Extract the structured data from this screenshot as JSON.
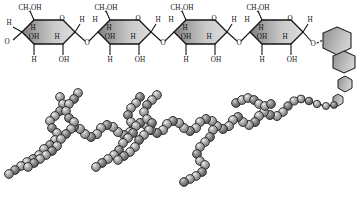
{
  "figure": {
    "name": "polysaccharide-structure-diagram",
    "background_color": "#ffffff",
    "ring_fill_dark": "#8a8a8a",
    "ring_fill_light": "#d8d8d8",
    "bond_color": "#1a1a1a",
    "bead_fill": "#9a9a9a",
    "bead_outline": "#2b2b2b",
    "bead_highlight": "#e2e2e2"
  },
  "glucose_rings": [
    {
      "index": 1,
      "top_label": "CH2OH",
      "top_label_main": "CH",
      "top_label_sub": "2",
      "top_label_tail": "OH",
      "ring_oxygen": "O",
      "left_h": "H",
      "left_o": "O",
      "interior_upper_h": "H",
      "interior_oh": "OH",
      "interior_right_h": "H",
      "bottom_left": "H",
      "bottom_right": "OH",
      "right_h": "H"
    },
    {
      "index": 2,
      "top_label": "CH2OH",
      "top_label_main": "CH",
      "top_label_sub": "2",
      "top_label_tail": "OH",
      "ring_oxygen": "O",
      "left_h": "H",
      "left_o": "O",
      "interior_upper_h": "H",
      "interior_oh": "OH",
      "interior_right_h": "H",
      "bottom_left": "H",
      "bottom_right": "OH",
      "right_h": "H"
    },
    {
      "index": 3,
      "top_label": "CH2OH",
      "top_label_main": "CH",
      "top_label_sub": "2",
      "top_label_tail": "OH",
      "ring_oxygen": "O",
      "left_h": "H",
      "left_o": "O",
      "interior_upper_h": "H",
      "interior_oh": "OH",
      "interior_right_h": "H",
      "bottom_left": "H",
      "bottom_right": "OH",
      "right_h": "H"
    },
    {
      "index": 4,
      "top_label": "CH2OH",
      "top_label_main": "CH",
      "top_label_sub": "2",
      "top_label_tail": "OH",
      "ring_oxygen": "O",
      "left_h": "H",
      "left_o": "O",
      "interior_upper_h": "H",
      "interior_oh": "OH",
      "interior_right_h": "H",
      "bottom_left": "H",
      "bottom_right": "OH",
      "right_h": "H"
    }
  ],
  "glycosidic_links": [
    {
      "oxygen": "O",
      "left_h": "H",
      "right_h": "H"
    },
    {
      "oxygen": "O",
      "left_h": "H",
      "right_h": "H"
    },
    {
      "oxygen": "O",
      "left_h": "H",
      "right_h": "H"
    }
  ],
  "terminal_link": {
    "oxygen": "O",
    "h": "H"
  },
  "plain_hexagons": [
    {
      "cx": 325,
      "cy": 40,
      "r": 15,
      "rot": 0
    },
    {
      "cx": 344,
      "cy": 62,
      "r": 12,
      "rot": 10
    },
    {
      "cx": 345,
      "cy": 83,
      "r": 8,
      "rot": 0
    },
    {
      "cx": 338,
      "cy": 97,
      "r": 5.5,
      "rot": 0
    }
  ]
}
